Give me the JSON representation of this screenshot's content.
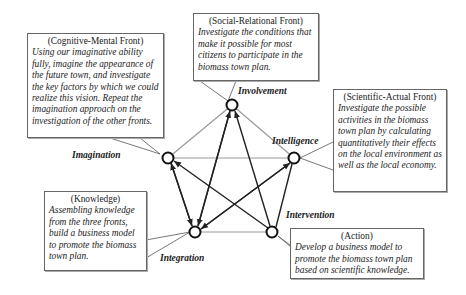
{
  "nodes": {
    "involvement": {
      "label": "Involvement"
    },
    "imagination": {
      "label": "Imagination"
    },
    "intelligence": {
      "label": "Intelligence"
    },
    "integration": {
      "label": "Integration"
    },
    "intervention": {
      "label": "Intervention"
    }
  },
  "boxes": {
    "cognitive": {
      "title": "(Cognitive-Mental  Front)",
      "body": "Using our imaginative ability fully, imagine the appearance of the future town, and investigate the key factors by which we could realize this vision. Repeat the imagination approach on the investigation of the other fronts."
    },
    "social": {
      "title": "(Social-Relational  Front)",
      "body": "Investigate the conditions that make it possible for most citizens to participate in the biomass town plan."
    },
    "scientific": {
      "title": "(Scientific-Actual  Front)",
      "body": "Investigate the possible activities in the biomass town plan by calculating quantitatively their effects on the local environment as well as the local economy."
    },
    "knowledge": {
      "title": "(Knowledge)",
      "body": "Assembling knowledge from the three fronts, build a business model to promote the biomass town plan."
    },
    "action": {
      "title": "(Action)",
      "body": "Develop a business model to promote the biomass town plan based on scientific knowledge."
    }
  },
  "colors": {
    "line": "#888888",
    "arrow": "#222222",
    "node_stroke": "#111111",
    "box_border": "#666666"
  }
}
